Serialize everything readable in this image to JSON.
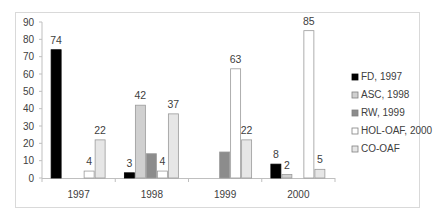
{
  "chart_data": {
    "type": "bar",
    "title": "",
    "xlabel": "",
    "ylabel": "",
    "categories": [
      "1997",
      "1998",
      "1999",
      "2000"
    ],
    "ylim": [
      0,
      90
    ],
    "yticks": [
      0,
      10,
      20,
      30,
      40,
      50,
      60,
      70,
      80,
      90
    ],
    "grid": false,
    "legend_position": "right",
    "series": [
      {
        "name": "FD, 1997",
        "color": "#000000",
        "values": [
          74,
          3,
          null,
          8
        ],
        "labels": [
          "74",
          "3",
          "",
          "8"
        ]
      },
      {
        "name": "ASC, 1998",
        "color": "#d0d0d0",
        "values": [
          null,
          42,
          null,
          2
        ],
        "labels": [
          "",
          "42",
          "",
          "2"
        ]
      },
      {
        "name": "RW, 1999",
        "color": "#8c8c8c",
        "values": [
          null,
          14,
          15,
          null
        ],
        "labels": [
          "",
          "",
          "",
          ""
        ]
      },
      {
        "name": "HOL-OAF, 2000",
        "color": "#ffffff",
        "values": [
          4,
          4,
          63,
          85
        ],
        "labels": [
          "4",
          "4",
          "63",
          "85"
        ]
      },
      {
        "name": "CO-OAF",
        "color": "#e6e6e6",
        "values": [
          22,
          37,
          22,
          5
        ],
        "labels": [
          "22",
          "37",
          "22",
          "5"
        ]
      }
    ]
  }
}
